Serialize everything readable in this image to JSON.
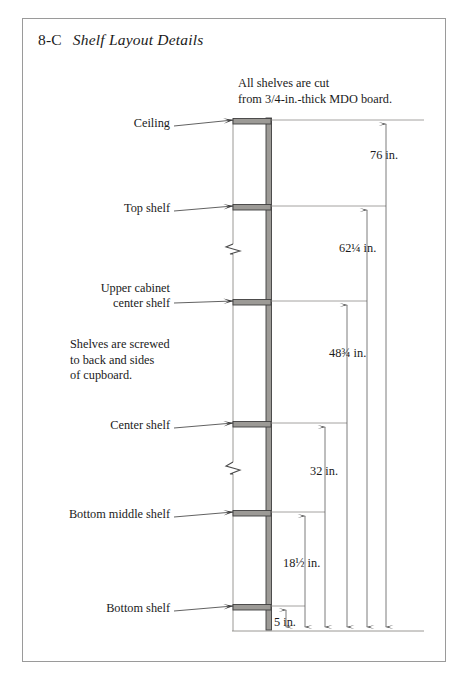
{
  "plate": {
    "figure_number": "8-C",
    "title": "Shelf Layout Details"
  },
  "notes": {
    "material": "All shelves are cut\nfrom 3/4-in.-thick MDO board.",
    "fastening": "Shelves are screwed\nto back and sides\nof cupboard."
  },
  "callouts": [
    {
      "label": "Ceiling",
      "y": 123
    },
    {
      "label": "Top shelf",
      "y": 208
    },
    {
      "label": "Upper cabinet\ncenter shelf",
      "y": 303
    },
    {
      "label": "Center shelf",
      "y": 425
    },
    {
      "label": "Bottom middle shelf",
      "y": 514
    },
    {
      "label": "Bottom shelf",
      "y": 608
    }
  ],
  "dimensions": [
    {
      "label": "76 in.",
      "value": 76,
      "unit": "in.",
      "from": "floor",
      "to": "Ceiling"
    },
    {
      "label": "62¼ in.",
      "value": 62.25,
      "unit": "in.",
      "from": "floor",
      "to": "Top shelf"
    },
    {
      "label": "48¾ in.",
      "value": 48.75,
      "unit": "in.",
      "from": "floor",
      "to": "Upper cabinet center shelf"
    },
    {
      "label": "32 in.",
      "value": 32,
      "unit": "in.",
      "from": "floor",
      "to": "Center shelf"
    },
    {
      "label": "18½ in.",
      "value": 18.5,
      "unit": "in.",
      "from": "floor",
      "to": "Bottom middle shelf"
    },
    {
      "label": "5 in.",
      "value": 5,
      "unit": "in.",
      "from": "floor",
      "to": "Bottom shelf"
    }
  ],
  "colors": {
    "frame": "#9a9a9a",
    "line": "#4a4a4a",
    "shelf_fill": "#9c9a96",
    "wall_fill": "#8e8c88",
    "ink": "#1a1a1a"
  },
  "symbols": {
    "break_marks": 2,
    "leader_arrows": 6,
    "dimension_arrows": 12
  }
}
